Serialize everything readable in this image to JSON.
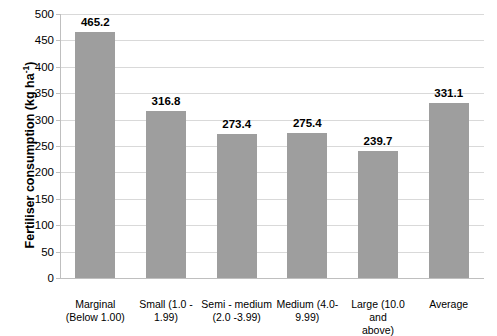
{
  "chart_data": {
    "type": "bar",
    "title": "",
    "xlabel": "",
    "ylabel": "Fertiliser consumption (kg ha-1)",
    "ylabel_main": "Fertiliser consumption (kg ha",
    "ylabel_sup": "-1",
    "ylabel_tail": ")",
    "categories": [
      "Marginal (Below 1.00)",
      "Small (1.0 - 1.99)",
      "Semi - medium (2.0 -3.99)",
      "Medium (4.0- 9.99)",
      "Large (10.0 and above)",
      "Average"
    ],
    "category_lines": [
      [
        "Marginal",
        "(Below 1.00)"
      ],
      [
        "Small (1.0 -",
        "1.99)"
      ],
      [
        "Semi - medium",
        "(2.0 -3.99)"
      ],
      [
        "Medium (4.0-",
        "9.99)"
      ],
      [
        "Large (10.0 and",
        "above)"
      ],
      [
        "Average"
      ]
    ],
    "values": [
      465.2,
      316.8,
      273.4,
      275.4,
      239.7,
      331.1
    ],
    "value_labels": [
      "465.2",
      "316.8",
      "273.4",
      "275.4",
      "239.7",
      "331.1"
    ],
    "ylim": [
      0,
      500
    ],
    "ytick_labels": [
      "0",
      "50",
      "100",
      "150",
      "200",
      "250",
      "300",
      "350",
      "400",
      "450",
      "500"
    ],
    "ytick_values": [
      0,
      50,
      100,
      150,
      200,
      250,
      300,
      350,
      400,
      450,
      500
    ],
    "grid": true,
    "legend": "none",
    "bar_color": "#9e9e9e",
    "grid_color": "#d9d9d9",
    "axis_color": "#bfbfbf",
    "text_color": "#000000"
  }
}
